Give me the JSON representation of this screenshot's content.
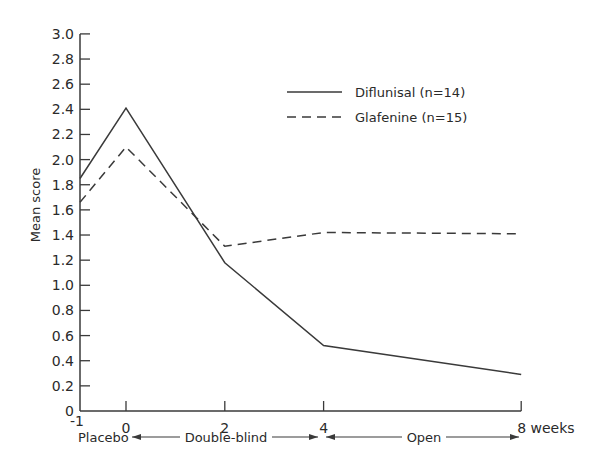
{
  "chart_data": {
    "type": "line",
    "title": "",
    "xlabel": "weeks",
    "ylabel": "Mean score",
    "x": [
      -1,
      0,
      2,
      4,
      8
    ],
    "x_tick_labels": [
      "-1",
      "0",
      "2",
      "4",
      "8 weeks"
    ],
    "y_ticks": [
      0,
      0.2,
      0.4,
      0.6,
      0.8,
      1.0,
      1.2,
      1.4,
      1.6,
      1.8,
      2.0,
      2.2,
      2.4,
      2.6,
      2.8,
      3.0
    ],
    "y_tick_labels": [
      "0",
      "0.2",
      "0.4",
      "0.6",
      "0.8",
      "1.0",
      "1.2",
      "1.4",
      "1.6",
      "1.8",
      "2.0",
      "2.2",
      "2.4",
      "2.6",
      "2.8",
      "3.0"
    ],
    "ylim": [
      0,
      3.0
    ],
    "xlim": [
      -1,
      8
    ],
    "grid": false,
    "legend_position": "upper right",
    "series": [
      {
        "name": "Diflunisal (n=14)",
        "style": "solid",
        "values": [
          1.85,
          2.41,
          1.18,
          0.52,
          0.29
        ]
      },
      {
        "name": "Glafenine (n=15)",
        "style": "dashed",
        "values": [
          1.66,
          2.1,
          1.31,
          1.42,
          1.41
        ]
      }
    ],
    "phases": [
      {
        "label": "Placebo",
        "from": -1,
        "to": 0
      },
      {
        "label": "Double-blind",
        "from": 0,
        "to": 4
      },
      {
        "label": "Open",
        "from": 4,
        "to": 8
      }
    ],
    "colors": {
      "line": "#3a3a3a",
      "text": "#2a2a2a",
      "background": "#ffffff"
    }
  }
}
